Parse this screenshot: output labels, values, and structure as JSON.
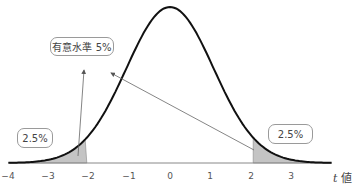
{
  "chart_data": {
    "type": "area",
    "title": "",
    "xlabel_var": "t",
    "xlabel_unit": "値",
    "xlim": [
      -4,
      4
    ],
    "x_ticks": [
      "-4",
      "-3",
      "-2",
      "-1",
      "0",
      "1",
      "2",
      "3"
    ],
    "critical_values": [
      -2.06,
      2.06
    ],
    "shaded_regions": [
      {
        "from": -4,
        "to": -2.06,
        "label": "2.5%"
      },
      {
        "from": 2.06,
        "to": 4,
        "label": "2.5%"
      }
    ],
    "annotations": [
      {
        "text": "有意水準 5%",
        "points_to": [
          "left-tail",
          "right-tail"
        ]
      },
      {
        "text": "2.5%",
        "region": "left-tail"
      },
      {
        "text": "2.5%",
        "region": "right-tail"
      }
    ]
  },
  "labels": {
    "significance": "有意水準 5%",
    "left_tail": "2.5%",
    "right_tail": "2.5%",
    "axis_var": "t",
    "axis_unit": " 値"
  },
  "ticks": [
    "−4",
    "−3",
    "−2",
    "−1",
    "0",
    "1",
    "2",
    "3"
  ],
  "colors": {
    "curve": "#111111",
    "shade": "#c4c4c4",
    "axis": "#777777",
    "arrow": "#666666"
  }
}
